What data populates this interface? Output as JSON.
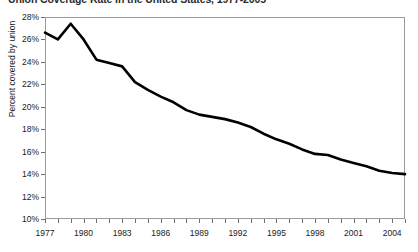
{
  "chart_data": {
    "type": "line",
    "title": "Union Coverage Rate in the United States, 1977-2005",
    "xlabel": "",
    "ylabel": "Percent covered by union",
    "grid": false,
    "legend": "none",
    "xlim": [
      1977,
      2005
    ],
    "ylim": [
      10,
      28
    ],
    "y_tick_labels": [
      "28%",
      "26%",
      "24%",
      "22%",
      "20%",
      "18%",
      "16%",
      "14%",
      "12%",
      "10%"
    ],
    "y_tick_values": [
      28,
      26,
      24,
      22,
      20,
      18,
      16,
      14,
      12,
      10
    ],
    "x_tick_labels": [
      "1977",
      "1980",
      "1983",
      "1986",
      "1989",
      "1992",
      "1995",
      "1998",
      "2001",
      "2004"
    ],
    "x_tick_values": [
      1977,
      1980,
      1983,
      1986,
      1989,
      1992,
      1995,
      1998,
      2001,
      2004
    ],
    "x_minor_ticks": [
      1977,
      1978,
      1979,
      1980,
      1981,
      1982,
      1983,
      1984,
      1985,
      1986,
      1987,
      1988,
      1989,
      1990,
      1991,
      1992,
      1993,
      1994,
      1995,
      1996,
      1997,
      1998,
      1999,
      2000,
      2001,
      2002,
      2003,
      2004,
      2005
    ],
    "line_color": "#000000",
    "line_width": 2.6,
    "x": [
      1977,
      1978,
      1979,
      1980,
      1981,
      1982,
      1983,
      1984,
      1985,
      1986,
      1987,
      1988,
      1989,
      1990,
      1991,
      1992,
      1993,
      1994,
      1995,
      1996,
      1997,
      1998,
      1999,
      2000,
      2001,
      2002,
      2003,
      2004,
      2005
    ],
    "series": [
      {
        "name": "Percent covered by union",
        "values": [
          26.6,
          26.0,
          27.4,
          26.0,
          24.2,
          23.9,
          23.6,
          22.2,
          21.5,
          20.9,
          20.4,
          19.7,
          19.3,
          19.1,
          18.9,
          18.6,
          18.2,
          17.6,
          17.1,
          16.7,
          16.2,
          15.8,
          15.7,
          15.3,
          15.0,
          14.7,
          14.3,
          14.1,
          14.0
        ]
      }
    ]
  }
}
